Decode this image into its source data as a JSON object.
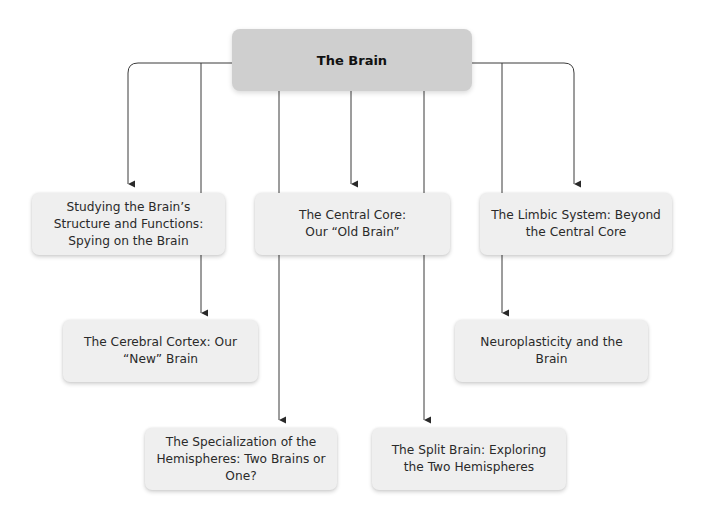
{
  "diagram": {
    "title": "The Brain",
    "colors": {
      "root_fill": "#cfcfcf",
      "node_fill": "#efefef",
      "line": "#3a3a3a"
    },
    "nodes": [
      {
        "id": "n1",
        "label": "Studying the Brain’s Structure and Functions: Spying on the Brain"
      },
      {
        "id": "n2",
        "label": "The Central Core: Our “Old Brain”"
      },
      {
        "id": "n3",
        "label": "The Limbic System: Beyond the Central Core"
      },
      {
        "id": "n4",
        "label": "The Cerebral Cortex: Our “New” Brain"
      },
      {
        "id": "n5",
        "label": "Neuroplasticity and the Brain"
      },
      {
        "id": "n6",
        "label": "The Specialization of the Hemispheres: Two Brains or One?"
      },
      {
        "id": "n7",
        "label": "The Split Brain: Exploring the Two Hemispheres"
      }
    ],
    "edges": [
      {
        "from": "root",
        "to": "n1"
      },
      {
        "from": "root",
        "to": "n2"
      },
      {
        "from": "root",
        "to": "n3"
      },
      {
        "from": "root",
        "to": "n4"
      },
      {
        "from": "root",
        "to": "n5"
      },
      {
        "from": "root",
        "to": "n6"
      },
      {
        "from": "root",
        "to": "n7"
      }
    ]
  }
}
